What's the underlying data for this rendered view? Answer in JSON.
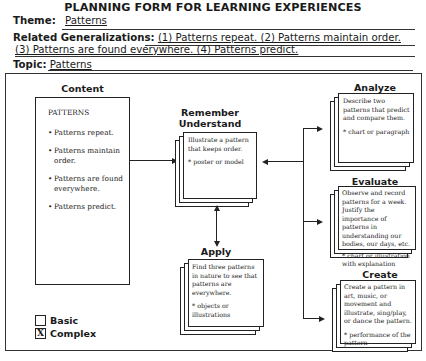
{
  "form": {
    "title": "PLANNING FORM FOR LEARNING EXPERIENCES",
    "theme_label": "Theme:",
    "theme_value": "Patterns",
    "generalizations_label": "Related Generalizations:",
    "generalizations_line1": "(1) Patterns repeat.  (2) Patterns maintain order.",
    "generalizations_line2": "(3) Patterns are found everywhere. (4) Patterns predict.",
    "topic_label": "Topic:",
    "topic_value": "Patterns"
  },
  "content": {
    "heading": "Content",
    "title": "PATTERNS",
    "items": [
      "Patterns repeat.",
      "Patterns maintain order.",
      "Patterns are found everywhere.",
      "Patterns predict."
    ]
  },
  "remember": {
    "heading_line1": "Remember",
    "heading_line2": "Understand",
    "task": "Illustrate a pattern that keeps order.",
    "product": "* poster or model"
  },
  "apply": {
    "heading": "Apply",
    "task": "Find three patterns in nature to see that patterns are everywhere.",
    "product": "* objects or illustrations"
  },
  "analyze": {
    "heading": "Analyze",
    "task": "Describe two patterns that predict and compare them.",
    "product": "* chart or paragraph"
  },
  "evaluate": {
    "heading": "Evaluate",
    "task": "Observe and record patterns for a week. Justify the importance of patterns in understanding our bodies, our days, etc.",
    "product": "* chart or illustration with explanation"
  },
  "create": {
    "heading": "Create",
    "task": "Create a pattern in art, music, or movement and illustrate, sing/play, or dance the pattern.",
    "product": "* performance of the pattern"
  },
  "levels": {
    "basic_label": "Basic",
    "basic_mark": "",
    "complex_label": "Complex",
    "complex_mark": "X"
  }
}
